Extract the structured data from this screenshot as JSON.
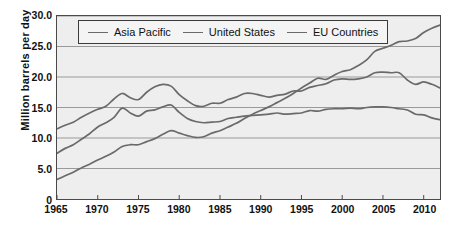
{
  "chart_data": {
    "type": "line",
    "title": "",
    "subtitle": "",
    "xlabel": "",
    "ylabel": "Million  barrels  per  day",
    "xlim": [
      1965,
      2012
    ],
    "ylim": [
      0,
      30
    ],
    "grid": true,
    "legend_position": "top-center",
    "xticks": [
      "1965",
      "1970",
      "1975",
      "1980",
      "1985",
      "1990",
      "1995",
      "2000",
      "2005",
      "2010"
    ],
    "xtick_values": [
      1965,
      1970,
      1975,
      1980,
      1985,
      1990,
      1995,
      2000,
      2005,
      2010
    ],
    "yticks": [
      "0",
      "5.0",
      "10.0",
      "15.0",
      "20.0",
      "25.0",
      "30.0"
    ],
    "ytick_values": [
      0,
      5,
      10,
      15,
      20,
      25,
      30
    ],
    "x": [
      1965,
      1966,
      1967,
      1968,
      1969,
      1970,
      1971,
      1972,
      1973,
      1974,
      1975,
      1976,
      1977,
      1978,
      1979,
      1980,
      1981,
      1982,
      1983,
      1984,
      1985,
      1986,
      1987,
      1988,
      1989,
      1990,
      1991,
      1992,
      1993,
      1994,
      1995,
      1996,
      1997,
      1998,
      1999,
      2000,
      2001,
      2002,
      2003,
      2004,
      2005,
      2006,
      2007,
      2008,
      2009,
      2010,
      2011,
      2012
    ],
    "series": [
      {
        "name": "Asia Pacific",
        "color": "#6a6a6a",
        "values": [
          3.2,
          3.8,
          4.4,
          5.1,
          5.7,
          6.4,
          7.0,
          7.7,
          8.6,
          8.9,
          8.9,
          9.4,
          9.9,
          10.6,
          11.2,
          10.8,
          10.4,
          10.1,
          10.2,
          10.8,
          11.2,
          11.8,
          12.4,
          13.2,
          13.9,
          14.5,
          15.1,
          15.8,
          16.5,
          17.3,
          18.2,
          19.0,
          19.8,
          19.6,
          20.3,
          20.9,
          21.2,
          21.9,
          22.8,
          24.2,
          24.7,
          25.2,
          25.8,
          25.9,
          26.3,
          27.3,
          28.0,
          28.5
        ]
      },
      {
        "name": "United States",
        "color": "#6a6a6a",
        "values": [
          11.5,
          12.1,
          12.6,
          13.4,
          14.1,
          14.7,
          15.2,
          16.4,
          17.3,
          16.6,
          16.3,
          17.5,
          18.4,
          18.8,
          18.5,
          17.1,
          16.1,
          15.3,
          15.2,
          15.7,
          15.7,
          16.3,
          16.7,
          17.3,
          17.3,
          17.0,
          16.7,
          17.0,
          17.2,
          17.7,
          17.7,
          18.3,
          18.6,
          18.9,
          19.5,
          19.7,
          19.6,
          19.7,
          20.0,
          20.7,
          20.8,
          20.7,
          20.7,
          19.5,
          18.8,
          19.2,
          18.8,
          18.2
        ]
      },
      {
        "name": "EU Countries",
        "color": "#6a6a6a",
        "values": [
          7.5,
          8.3,
          8.9,
          9.8,
          10.7,
          11.8,
          12.5,
          13.4,
          14.9,
          14.1,
          13.6,
          14.4,
          14.6,
          15.1,
          15.4,
          14.2,
          13.2,
          12.7,
          12.5,
          12.6,
          12.7,
          13.2,
          13.4,
          13.6,
          13.7,
          13.8,
          13.9,
          14.1,
          13.9,
          14.0,
          14.1,
          14.5,
          14.4,
          14.7,
          14.8,
          14.8,
          14.9,
          14.8,
          15.0,
          15.1,
          15.1,
          15.0,
          14.8,
          14.6,
          13.9,
          13.8,
          13.3,
          13.0
        ]
      }
    ]
  },
  "legend": {
    "items": [
      {
        "label": "Asia Pacific"
      },
      {
        "label": "United States"
      },
      {
        "label": "EU Countries"
      }
    ]
  },
  "colors": {
    "plot_background": "#eeeeee",
    "grid": "#9a9a9a",
    "axis": "#4a4a4a",
    "line": "#6a6a6a",
    "text": "#111111"
  }
}
